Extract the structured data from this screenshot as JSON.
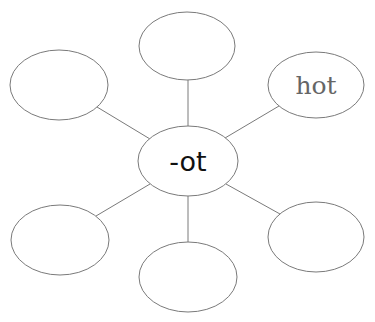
{
  "diagram": {
    "type": "word-web",
    "center": {
      "label": "-ot",
      "cx": 188,
      "cy": 161,
      "rx": 50,
      "ry": 35
    },
    "nodes": [
      {
        "id": "top",
        "label": "",
        "cx": 187,
        "cy": 46,
        "rx": 48,
        "ry": 34
      },
      {
        "id": "upper-left",
        "label": "",
        "cx": 59,
        "cy": 85,
        "rx": 49,
        "ry": 35
      },
      {
        "id": "upper-right",
        "label": "hot",
        "cx": 316,
        "cy": 85,
        "rx": 48,
        "ry": 33
      },
      {
        "id": "lower-left",
        "label": "",
        "cx": 60,
        "cy": 240,
        "rx": 49,
        "ry": 35
      },
      {
        "id": "bottom",
        "label": "",
        "cx": 188,
        "cy": 277,
        "rx": 49,
        "ry": 35
      },
      {
        "id": "lower-right",
        "label": "",
        "cx": 316,
        "cy": 237,
        "rx": 48,
        "ry": 35
      }
    ],
    "colors": {
      "stroke": "#7a7a7a",
      "center_text": "#111111",
      "leaf_text": "#666666"
    }
  }
}
